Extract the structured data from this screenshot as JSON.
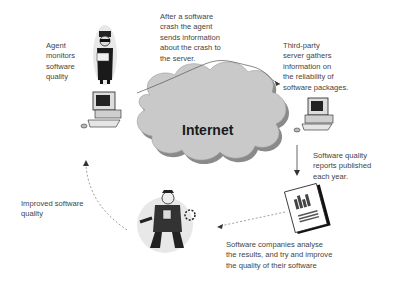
{
  "diagram": {
    "cloud_label": "Internet",
    "labels": {
      "agent": "Agent\nmonitors\nsoftware\nquality",
      "crash": "After a software\ncrash the agent\nsends information\nabout the crash to\nthe server.",
      "server": "Third-party\nserver gathers\ninformation on\nthe reliability of\nsoftware packages.",
      "reports": "Software quality\nreports published\neach year.",
      "companies": "Software companies  analyse\nthe results, and try and improve\nthe quality of their software",
      "improved": "Improved software\nquality"
    },
    "icons": [
      "agent-figure",
      "client-computer",
      "internet-cloud",
      "server-computer",
      "report-document",
      "mechanic-figure"
    ],
    "colors": {
      "cloud_fill": "#c8c8c8",
      "cloud_shadow": "#8a8a8a",
      "line": "#555555"
    }
  }
}
